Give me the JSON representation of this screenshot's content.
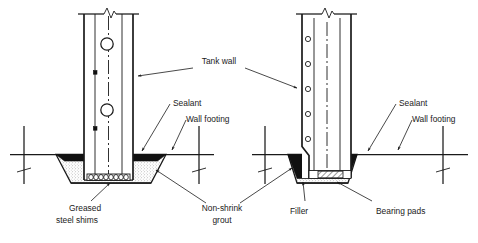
{
  "figure": {
    "background_color": "#ffffff",
    "line_color": "#1a1a1a",
    "fill_black_color": "#111111",
    "stipple_color": "#d9d9d9",
    "width": 478,
    "height": 243
  },
  "labels": {
    "tank_wall": "Tank wall",
    "sealant_left": "Sealant",
    "wall_footing_left": "Wall footing",
    "sealant_right": "Sealant",
    "wall_footing_right": "Wall footing",
    "greased_line1": "Greased",
    "greased_line2": "steel shims",
    "non_shrink_line1": "Non-shrink",
    "non_shrink_line2": "grout",
    "filler": "Filler",
    "bearing_pads": "Bearing pads"
  },
  "details": {
    "left_detail_name": "greased-steel-shim-detail",
    "right_detail_name": "bearing-pad-filler-detail"
  },
  "icons": {
    "break_symbol": "zigzag-break-icon",
    "arrow": "leader-arrow-icon",
    "tendon": "tendon-circle-icon",
    "anchor": "anchor-square-icon",
    "shim": "shim-stack-icon",
    "hatch": "hatch-pattern-icon"
  }
}
